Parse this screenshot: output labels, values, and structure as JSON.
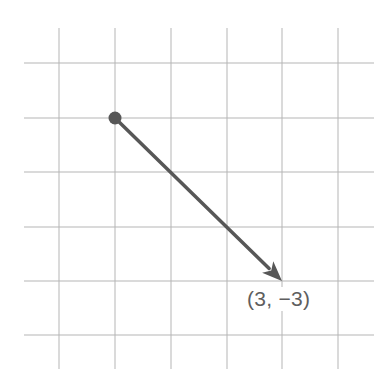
{
  "figure": {
    "type": "vector-on-grid",
    "grid": {
      "columns_x_px": [
        59,
        115,
        171,
        227,
        282,
        338
      ],
      "rows_y_px": [
        63,
        118,
        172,
        227,
        281,
        335
      ],
      "v_line_top_px": 28,
      "v_line_bottom_px": 369,
      "h_line_left_px": 24,
      "h_line_right_px": 374,
      "line_color": "#b5b5b5"
    },
    "vector": {
      "start_grid": {
        "col": 1,
        "row": 1
      },
      "end_grid": {
        "col": 4,
        "row": 4
      },
      "components": [
        3,
        -3
      ],
      "color": "#575757",
      "stroke_width": 3.5
    },
    "label": "(3, −3)"
  },
  "chart_data": {
    "type": "vector",
    "title": "",
    "xlabel": "",
    "ylabel": "",
    "grid": true,
    "vectors": [
      {
        "from": [
          0,
          0
        ],
        "to": [
          3,
          -3
        ],
        "label": "(3, −3)"
      }
    ],
    "grid_spacing": 1
  }
}
